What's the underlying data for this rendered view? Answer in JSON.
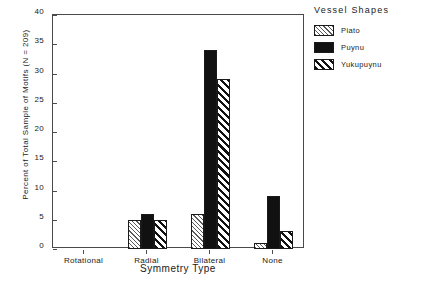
{
  "chart_data": {
    "type": "bar",
    "title": "",
    "xlabel": "Symmetry Type",
    "ylabel": "Percent of Total Sample of Motifs (N = 209)",
    "categories": [
      "Rotational",
      "Radial",
      "Bilateral",
      "None"
    ],
    "series": [
      {
        "name": "Piato",
        "pattern": "light-hatch",
        "values": [
          0,
          5,
          6,
          1
        ]
      },
      {
        "name": "Puynu",
        "pattern": "solid-black",
        "values": [
          0,
          6,
          34,
          9
        ]
      },
      {
        "name": "Yukupuynu",
        "pattern": "bold-hatch",
        "values": [
          0,
          5,
          29,
          3
        ]
      }
    ],
    "ylim": [
      0,
      40
    ],
    "yticks": [
      0,
      5,
      10,
      15,
      20,
      25,
      30,
      35,
      40
    ],
    "ytick_labels": [
      "0",
      "5",
      "10",
      "15",
      "20",
      "25",
      "30",
      "35",
      "40"
    ],
    "grid": false,
    "legend_position": "right"
  },
  "legend": {
    "title": "Vessel Shapes",
    "entries": [
      {
        "label": "Piato"
      },
      {
        "label": "Puynu"
      },
      {
        "label": "Yukupuynu"
      }
    ]
  },
  "axes": {
    "x_title": "Symmetry Type",
    "y_title": "Percent of Total Sample of Motifs (N = 209)"
  }
}
